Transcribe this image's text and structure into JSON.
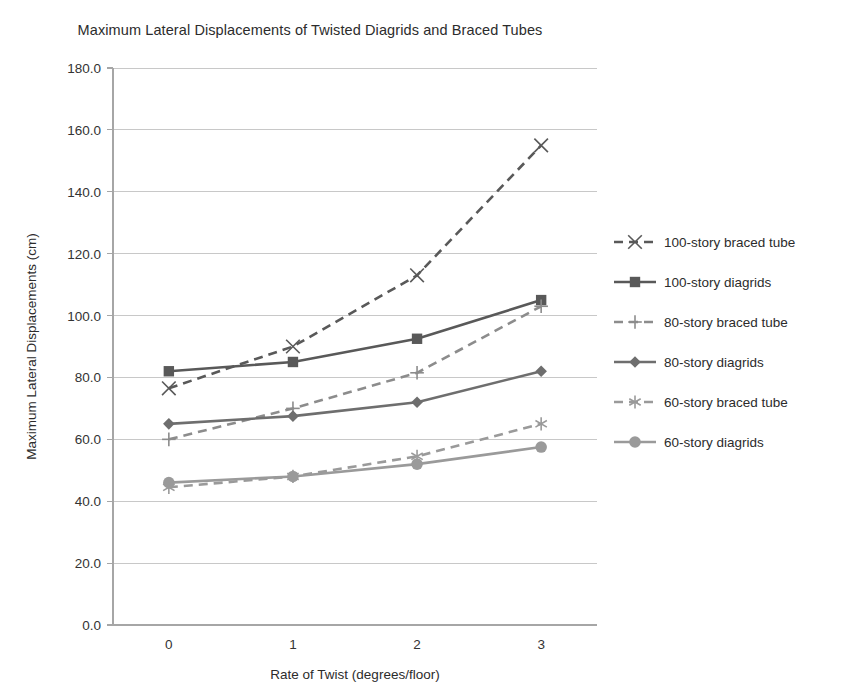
{
  "chart_data": {
    "type": "line",
    "title": "Maximum Lateral Displacements of Twisted Diagrids and Braced Tubes",
    "xlabel": "Rate of Twist (degrees/floor)",
    "ylabel": "Maximum Lateral Displacements (cm)",
    "x": [
      0,
      1,
      2,
      3
    ],
    "xtick_labels": [
      "0",
      "1",
      "2",
      "3"
    ],
    "ytick_labels": [
      "0.0",
      "20.0",
      "40.0",
      "60.0",
      "80.0",
      "100.0",
      "120.0",
      "140.0",
      "160.0",
      "180.0"
    ],
    "ytick_values": [
      0,
      20,
      40,
      60,
      80,
      100,
      120,
      140,
      160,
      180
    ],
    "ylim": [
      0,
      180
    ],
    "xlim": [
      -0.45,
      3.45
    ],
    "grid": "horizontal",
    "legend_position": "right",
    "series": [
      {
        "name": "100-story braced tube",
        "values": [
          76.5,
          90.0,
          113.0,
          155.0
        ],
        "color": "#595959",
        "style": "dashed",
        "marker": "x"
      },
      {
        "name": "100-story diagrids",
        "values": [
          82.0,
          85.0,
          92.5,
          105.0
        ],
        "color": "#595959",
        "style": "solid",
        "marker": "square"
      },
      {
        "name": "80-story braced tube",
        "values": [
          60.0,
          70.0,
          81.5,
          103.0
        ],
        "color": "#8c8c8c",
        "style": "dashed",
        "marker": "plus"
      },
      {
        "name": "80-story diagrids",
        "values": [
          65.0,
          67.5,
          72.0,
          82.0
        ],
        "color": "#6e6e6e",
        "style": "solid",
        "marker": "diamond"
      },
      {
        "name": "60-story braced tube",
        "values": [
          44.5,
          48.0,
          54.5,
          65.0
        ],
        "color": "#9a9a9a",
        "style": "dashed",
        "marker": "asterisk"
      },
      {
        "name": "60-story diagrids",
        "values": [
          46.0,
          48.0,
          52.0,
          57.5
        ],
        "color": "#9a9a9a",
        "style": "solid",
        "marker": "circle"
      }
    ],
    "axis_color": "#a6a6a6",
    "grid_color": "#c8c8c8",
    "background": "#ffffff"
  }
}
